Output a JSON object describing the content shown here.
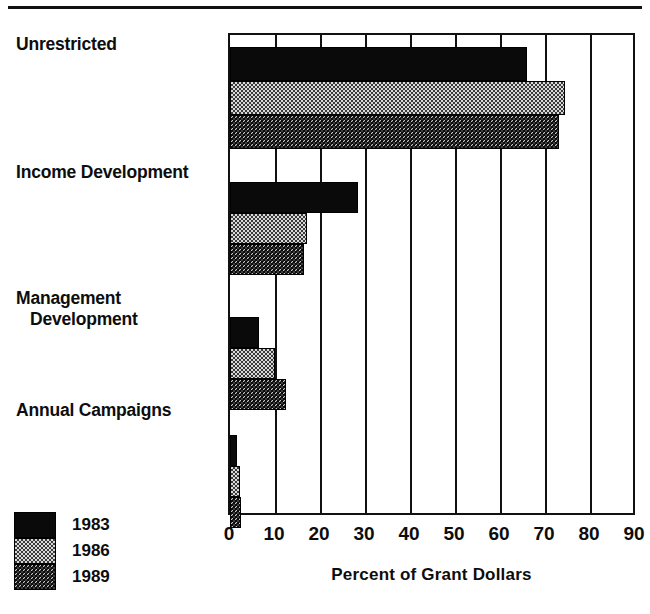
{
  "chart": {
    "title_partial": "",
    "xaxis_title": "Percent of  Grant Dollars",
    "legend": [
      {
        "label": "1983",
        "swatch": "solid-black-swatch"
      },
      {
        "label": "1986",
        "swatch": "light-checker-swatch"
      },
      {
        "label": "1989",
        "swatch": "dark-checker-swatch"
      }
    ]
  },
  "chart_data": {
    "type": "bar",
    "orientation": "horizontal",
    "title": "",
    "xlabel": "Percent of  Grant Dollars",
    "ylabel": "",
    "xlim": [
      0,
      90
    ],
    "xticks": [
      0,
      10,
      20,
      30,
      40,
      50,
      60,
      70,
      80,
      90
    ],
    "tick_labels": [
      "0",
      "10",
      "20",
      "30",
      "40",
      "50",
      "60",
      "70",
      "80",
      "90"
    ],
    "grid": true,
    "grid_axis": "x",
    "legend_position": "bottom-left",
    "categories": [
      "Unrestricted",
      "Income Development",
      "Management Development",
      "Annual Campaigns"
    ],
    "category_lines": [
      [
        "Unrestricted"
      ],
      [
        "Income Development"
      ],
      [
        "Management",
        "Development"
      ],
      [
        "Annual Campaigns"
      ]
    ],
    "series": [
      {
        "name": "1983",
        "color": "#0a0a0a",
        "pattern": "solid",
        "values": [
          66,
          28.5,
          6.5,
          1.5
        ]
      },
      {
        "name": "1986",
        "color": "#d8d8d8",
        "pattern": "light-checker",
        "values": [
          74.5,
          17,
          10,
          2.2
        ]
      },
      {
        "name": "1989",
        "color": "#3d3d3d",
        "pattern": "dark-checker",
        "values": [
          73,
          16.5,
          12.5,
          2.5
        ]
      }
    ]
  }
}
